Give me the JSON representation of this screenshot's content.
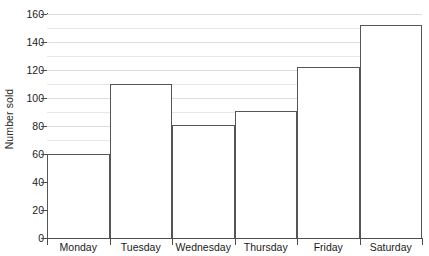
{
  "chart_data": {
    "type": "bar",
    "title": "",
    "xlabel": "",
    "ylabel": "Number sold",
    "categories": [
      "Monday",
      "Tuesday",
      "Wednesday",
      "Thursday",
      "Friday",
      "Saturday"
    ],
    "values": [
      60,
      110,
      81,
      91,
      122,
      152
    ],
    "ylim": [
      0,
      160
    ],
    "y_major_ticks": [
      0,
      20,
      40,
      60,
      80,
      100,
      120,
      140,
      160
    ],
    "y_tick_labels": [
      "0",
      "20",
      "40",
      "60",
      "80",
      "100",
      "120",
      "140",
      "160"
    ],
    "y_minor_gridlines": [
      10,
      30,
      50,
      70,
      90,
      110,
      130,
      150
    ],
    "grid": true,
    "grid_axis": "y",
    "legend": false,
    "legend_position": "none",
    "bar_gap": 0,
    "colors": {
      "bar_fill": "#ffffff",
      "bar_outline": "#555555",
      "gridline": "#e6e6e6",
      "gridline_major": "#dedede",
      "axis": "#4d4d4d",
      "text": "#1b1b1b",
      "background": "#ffffff"
    }
  }
}
